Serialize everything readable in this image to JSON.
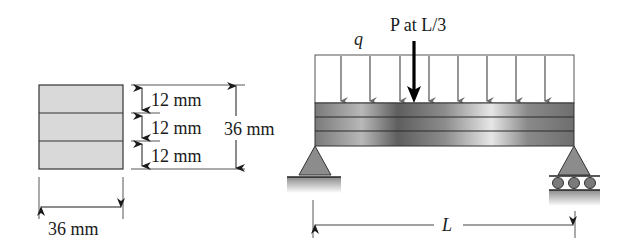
{
  "figure": {
    "cross_section": {
      "width_label": "36 mm",
      "total_height_label": "36 mm",
      "layers": [
        {
          "thickness_label": "12 mm"
        },
        {
          "thickness_label": "12 mm"
        },
        {
          "thickness_label": "12 mm"
        }
      ],
      "fill_color": "#d9d9d9"
    },
    "beam": {
      "distributed_load_label": "q",
      "point_load_label": "P at L/3",
      "span_label": "L",
      "left_support": "pin",
      "right_support": "roller",
      "layer_count": 3,
      "load_arrow_color": "#6a6a6a",
      "point_load_color": "#000000"
    }
  }
}
